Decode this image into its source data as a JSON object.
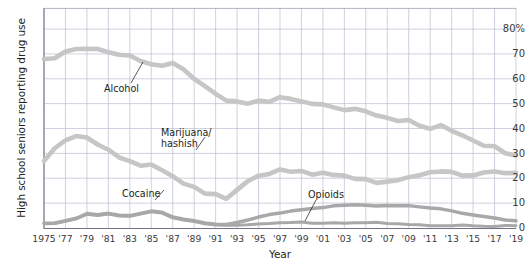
{
  "chart_data": {
    "type": "line",
    "title": "",
    "xlabel": "Year",
    "ylabel": "High school seniors reporting drug use",
    "ylim": [
      0,
      80
    ],
    "yticks": [
      0,
      10,
      20,
      30,
      40,
      50,
      60,
      70,
      80
    ],
    "ytick_labels": [
      "0",
      "10",
      "20",
      "30",
      "40",
      "50",
      "60",
      "70",
      "80%"
    ],
    "xlim": [
      1975,
      2019
    ],
    "xticks": [
      1975,
      1977,
      1979,
      1981,
      1983,
      1985,
      1987,
      1989,
      1991,
      1993,
      1995,
      1997,
      1999,
      2001,
      2003,
      2005,
      2007,
      2009,
      2011,
      2013,
      2015,
      2017,
      2019
    ],
    "xtick_labels": [
      "1975",
      "'77",
      "'79",
      "'81",
      "'83",
      "'85",
      "'87",
      "'89",
      "'91",
      "'93",
      "'95",
      "'97",
      "'99",
      "'01",
      "'03",
      "'05",
      "'07",
      "'09",
      "'11",
      "'13",
      "'15",
      "'17",
      "'19"
    ],
    "grid": true,
    "legend_position": "inline-annotations",
    "line_color": "#c6c6c6",
    "line_color_dark": "#a8a8a8",
    "grid_color": "#b9bfd0",
    "x": [
      1975,
      1976,
      1977,
      1978,
      1979,
      1980,
      1981,
      1982,
      1983,
      1984,
      1985,
      1986,
      1987,
      1988,
      1989,
      1990,
      1991,
      1992,
      1993,
      1994,
      1995,
      1996,
      1997,
      1998,
      1999,
      2000,
      2001,
      2002,
      2003,
      2004,
      2005,
      2006,
      2007,
      2008,
      2009,
      2010,
      2011,
      2012,
      2013,
      2014,
      2015,
      2016,
      2017,
      2018,
      2019
    ],
    "series": [
      {
        "name": "Alcohol",
        "values": [
          68,
          68.3,
          71,
          72,
          72.1,
          72,
          70.7,
          69.7,
          69.4,
          67.2,
          65.9,
          65.3,
          66.4,
          63.9,
          60,
          57.1,
          54,
          51.3,
          51,
          50.1,
          51.3,
          50.8,
          52.7,
          52,
          51,
          50,
          49.8,
          48.6,
          47.5,
          48,
          47,
          45.3,
          44.4,
          43.1,
          43.5,
          41.2,
          40,
          41.5,
          39.2,
          37.4,
          35.3,
          33.2,
          33,
          30.2,
          29.3
        ]
      },
      {
        "name": "Marijuana/hashish",
        "values": [
          27.1,
          32.2,
          35.4,
          37.1,
          36.5,
          33.7,
          31.6,
          28.5,
          27,
          25.2,
          25.7,
          23.4,
          21,
          18,
          16.7,
          14,
          13.8,
          11.9,
          15.5,
          19,
          21.2,
          21.9,
          23.7,
          22.8,
          23.1,
          21.6,
          22.4,
          21.5,
          21.2,
          19.9,
          19.8,
          18.3,
          18.8,
          19.4,
          20.6,
          21.4,
          22.6,
          22.9,
          22.7,
          21.2,
          21.3,
          22.5,
          22.9,
          22.2,
          22.3
        ]
      },
      {
        "name": "Cocaine",
        "values": [
          1.9,
          2,
          2.9,
          3.9,
          5.7,
          5.2,
          5.8,
          5,
          4.9,
          5.8,
          6.7,
          6.2,
          4.3,
          3.4,
          2.8,
          1.9,
          1.4,
          1.3,
          1.3,
          1.5,
          1.8,
          2,
          2.3,
          2.4,
          2.6,
          2.1,
          2.1,
          2.3,
          2.1,
          2.3,
          2.3,
          2.5,
          2,
          1.9,
          1.6,
          1.5,
          1.1,
          1.1,
          1.1,
          1.4,
          1.1,
          0.9,
          0.8,
          1.2,
          1.1
        ]
      },
      {
        "name": "Opioids",
        "values": [
          2.1,
          2.2,
          3.1,
          4.1,
          6,
          5.5,
          6.1,
          5.3,
          5.2,
          6.1,
          7,
          6.5,
          4.6,
          3.7,
          3.1,
          2.2,
          1.7,
          1.6,
          2.4,
          3.4,
          4.6,
          5.6,
          6.2,
          7,
          7.5,
          8,
          8.4,
          9.1,
          9.3,
          9.5,
          9.3,
          9,
          9.2,
          9.1,
          9.2,
          8.7,
          8.2,
          7.9,
          7.1,
          6.1,
          5.4,
          4.8,
          4.2,
          3.4,
          3.1
        ]
      }
    ],
    "annotations": [
      {
        "name": "alcohol-label",
        "text": "Alcohol",
        "line_label": "Alcohol"
      },
      {
        "name": "marijuana-label",
        "text_line1": "Marijuana/",
        "text_line2": "hashish"
      },
      {
        "name": "cocaine-label",
        "text": "Cocaine"
      },
      {
        "name": "opioids-label",
        "text": "Opioids"
      }
    ]
  }
}
